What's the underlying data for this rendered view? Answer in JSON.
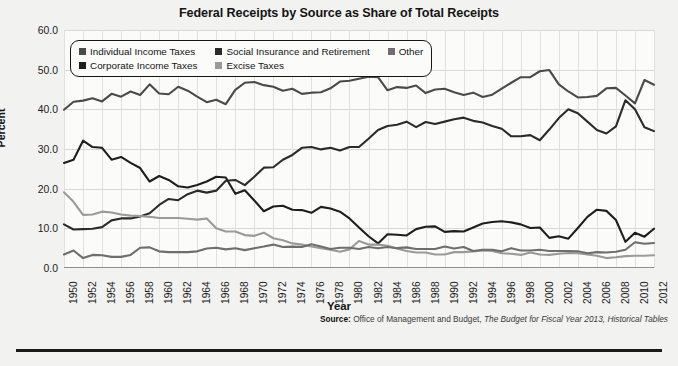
{
  "chart_data": {
    "type": "line",
    "title": "Federal Receipts by Source as Share of Total Receipts",
    "xlabel": "Year",
    "ylabel": "Percent",
    "ylim": [
      0.0,
      60.0
    ],
    "yticks": [
      "0.0",
      "10.0",
      "20.0",
      "30.0",
      "40.0",
      "50.0",
      "60.0"
    ],
    "xlim": [
      1950,
      2012
    ],
    "grid": true,
    "legend_position": "top-left-inside",
    "x": [
      1950,
      1951,
      1952,
      1953,
      1954,
      1955,
      1956,
      1957,
      1958,
      1959,
      1960,
      1961,
      1962,
      1963,
      1964,
      1965,
      1966,
      1967,
      1968,
      1969,
      1970,
      1971,
      1972,
      1973,
      1974,
      1975,
      1976,
      1977,
      1978,
      1979,
      1980,
      1981,
      1982,
      1983,
      1984,
      1985,
      1986,
      1987,
      1988,
      1989,
      1990,
      1991,
      1992,
      1993,
      1994,
      1995,
      1996,
      1997,
      1998,
      1999,
      2000,
      2001,
      2002,
      2003,
      2004,
      2005,
      2006,
      2007,
      2008,
      2009,
      2010,
      2011,
      2012
    ],
    "xtick_labels": [
      "1950",
      "1952",
      "1954",
      "1956",
      "1958",
      "1960",
      "1962",
      "1964",
      "1966",
      "1968",
      "1970",
      "1972",
      "1974",
      "1976",
      "1978",
      "1980",
      "1982",
      "1984",
      "1986",
      "1988",
      "1990",
      "1992",
      "1994",
      "1996",
      "1998",
      "2000",
      "2002",
      "2004",
      "2006",
      "2008",
      "2010",
      "2012"
    ],
    "series": [
      {
        "name": "Individual Income Taxes",
        "color": "#4a4a4a",
        "values": [
          39.9,
          41.9,
          42.2,
          42.8,
          42.0,
          43.9,
          43.2,
          44.5,
          43.6,
          46.3,
          44.0,
          43.8,
          45.7,
          44.7,
          43.2,
          41.8,
          42.4,
          41.3,
          44.9,
          46.7,
          46.9,
          46.1,
          45.7,
          44.7,
          45.2,
          43.9,
          44.2,
          44.3,
          45.3,
          47.0,
          47.2,
          47.7,
          48.2,
          48.1,
          44.8,
          45.6,
          45.4,
          46.0,
          44.1,
          45.0,
          45.2,
          44.3,
          43.6,
          44.2,
          43.1,
          43.7,
          45.2,
          46.7,
          48.1,
          48.1,
          49.6,
          49.9,
          46.3,
          44.5,
          43.0,
          43.1,
          43.4,
          45.3,
          45.4,
          43.5,
          41.5,
          47.4,
          46.2
        ]
      },
      {
        "name": "Corporate Income Taxes",
        "color": "#1e1e1e",
        "values": [
          26.5,
          27.3,
          32.1,
          30.5,
          30.3,
          27.3,
          28.0,
          26.5,
          25.2,
          21.8,
          23.2,
          22.2,
          20.6,
          20.3,
          20.9,
          21.8,
          23.0,
          22.8,
          18.7,
          19.6,
          17.0,
          14.3,
          15.5,
          15.7,
          14.7,
          14.6,
          13.9,
          15.4,
          15.0,
          14.2,
          12.5,
          10.2,
          8.0,
          6.2,
          8.5,
          8.4,
          8.2,
          9.8,
          10.4,
          10.5,
          9.1,
          9.3,
          9.2,
          10.2,
          11.2,
          11.6,
          11.8,
          11.5,
          11.0,
          10.1,
          10.2,
          7.6,
          8.0,
          7.4,
          10.1,
          12.9,
          14.7,
          14.4,
          12.1,
          6.6,
          8.9,
          7.9,
          9.9
        ]
      },
      {
        "name": "Social Insurance and Retirement",
        "color": "#2b2b2b",
        "values": [
          11.0,
          9.7,
          9.8,
          9.9,
          10.3,
          12.0,
          12.5,
          12.5,
          13.0,
          13.8,
          15.9,
          17.4,
          17.1,
          18.6,
          19.5,
          19.0,
          19.5,
          22.0,
          22.2,
          20.9,
          23.0,
          25.3,
          25.4,
          27.3,
          28.5,
          30.3,
          30.5,
          29.9,
          30.3,
          29.6,
          30.5,
          30.5,
          32.6,
          34.8,
          35.8,
          36.1,
          36.9,
          35.5,
          36.8,
          36.3,
          36.9,
          37.5,
          37.9,
          37.1,
          36.7,
          35.8,
          35.1,
          33.2,
          33.2,
          33.5,
          32.2,
          34.9,
          37.8,
          40.0,
          39.0,
          36.9,
          34.8,
          33.9,
          35.7,
          42.3,
          40.0,
          35.5,
          34.5
        ]
      },
      {
        "name": "Excise Taxes",
        "color": "#9a9a98",
        "values": [
          19.1,
          16.7,
          13.4,
          13.5,
          14.2,
          14.0,
          13.5,
          13.2,
          13.1,
          12.9,
          12.6,
          12.6,
          12.6,
          12.4,
          12.2,
          12.5,
          10.0,
          9.2,
          9.2,
          8.3,
          8.1,
          8.9,
          7.5,
          7.0,
          6.2,
          5.9,
          5.4,
          5.0,
          4.6,
          4.1,
          4.7,
          6.8,
          5.9,
          5.9,
          5.6,
          4.9,
          4.3,
          3.9,
          3.9,
          3.4,
          3.4,
          4.0,
          4.0,
          4.2,
          4.4,
          4.3,
          3.7,
          3.6,
          3.3,
          3.9,
          3.4,
          3.3,
          3.6,
          3.8,
          3.7,
          3.4,
          3.1,
          2.5,
          2.7,
          3.0,
          3.1,
          3.1,
          3.2
        ]
      },
      {
        "name": "Other",
        "color": "#6e6e6c",
        "values": [
          3.4,
          4.4,
          2.5,
          3.3,
          3.2,
          2.8,
          2.8,
          3.3,
          5.1,
          5.2,
          4.2,
          4.0,
          4.0,
          4.0,
          4.2,
          4.9,
          5.1,
          4.7,
          5.0,
          4.5,
          5.0,
          5.4,
          5.9,
          5.3,
          5.4,
          5.3,
          6.0,
          5.4,
          4.8,
          5.1,
          5.1,
          4.8,
          5.3,
          5.0,
          5.3,
          5.0,
          5.2,
          4.8,
          4.8,
          4.8,
          5.4,
          4.9,
          5.3,
          4.3,
          4.6,
          4.6,
          4.2,
          5.0,
          4.4,
          4.4,
          4.6,
          4.3,
          4.3,
          4.3,
          4.2,
          3.7,
          4.0,
          3.9,
          4.1,
          4.6,
          6.5,
          6.1,
          6.3
        ]
      }
    ],
    "source_prefix": "Source:",
    "source_plain_1": " Office of Management and Budget, ",
    "source_italic": "The Budget for Fiscal Year 2013, Historical Tables"
  }
}
